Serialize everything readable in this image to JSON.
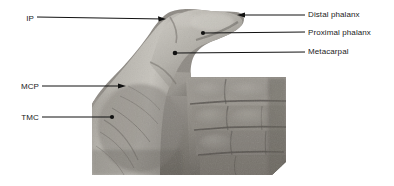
{
  "figure": {
    "kind": "annotated-photograph",
    "background_color": "#ffffff",
    "photo": {
      "tone": "grayscale",
      "left": 92,
      "top": 8,
      "right": 286,
      "bottom": 175,
      "palm_top": 78,
      "skin_light": "#c9c6c0",
      "skin_mid": "#9b9790",
      "skin_dark": "#6e6a64",
      "shadow": "#4a4743"
    }
  },
  "annotations": {
    "line_color": "#111111",
    "text_color": "#1a1a1a",
    "items": [
      {
        "id": "ip",
        "label": "IP",
        "side": "left",
        "marker": "arrow",
        "text_x": 22,
        "text_y": 14,
        "line_start_x": 37,
        "line_start_y": 17,
        "line_end_x": 166,
        "line_end_y": 19
      },
      {
        "id": "mcp",
        "label": "MCP",
        "side": "left",
        "marker": "arrow",
        "text_x": 14,
        "text_y": 82,
        "line_start_x": 42,
        "line_start_y": 86,
        "line_end_x": 126,
        "line_end_y": 86
      },
      {
        "id": "tmc",
        "label": "TMC",
        "side": "left",
        "marker": "dot",
        "text_x": 14,
        "text_y": 113,
        "line_start_x": 42,
        "line_start_y": 117,
        "line_end_x": 113,
        "line_end_y": 117
      },
      {
        "id": "distal-phalanx",
        "label": "Distal phalanx",
        "side": "right",
        "marker": "arrow",
        "text_x": 308,
        "text_y": 10,
        "line_start_x": 305,
        "line_start_y": 15,
        "line_end_x": 237,
        "line_end_y": 15
      },
      {
        "id": "proximal-phalanx",
        "label": "Proximal phalanx",
        "side": "right",
        "marker": "dot",
        "text_x": 308,
        "text_y": 28,
        "line_start_x": 305,
        "line_start_y": 32,
        "line_end_x": 203,
        "line_end_y": 33
      },
      {
        "id": "metacarpal",
        "label": "Metacarpal",
        "side": "right",
        "marker": "dot",
        "text_x": 308,
        "text_y": 47,
        "line_start_x": 305,
        "line_start_y": 52,
        "line_end_x": 175,
        "line_end_y": 53
      }
    ]
  }
}
